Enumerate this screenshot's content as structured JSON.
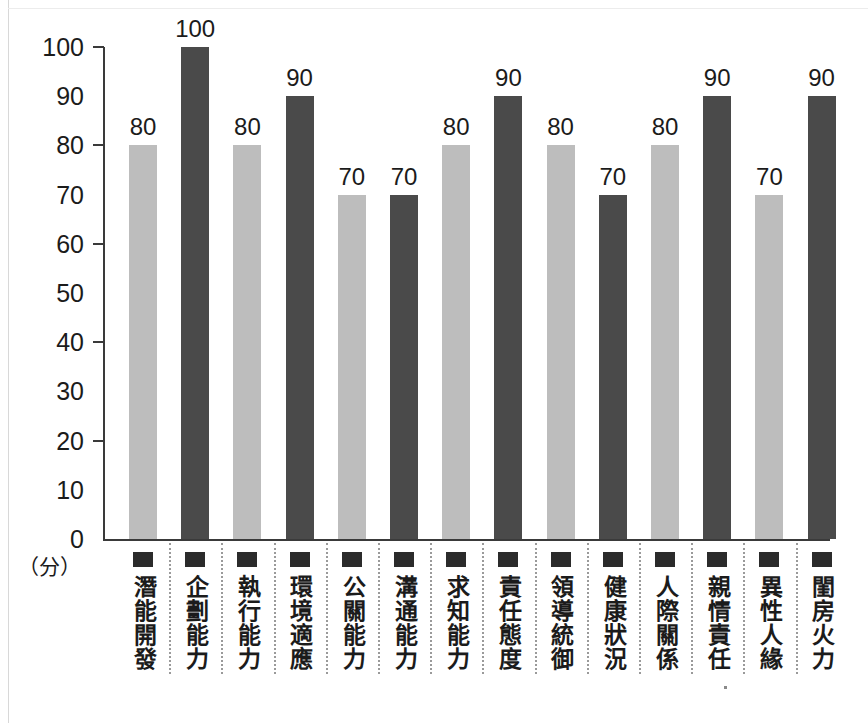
{
  "chart_data": {
    "type": "bar",
    "title": "",
    "subtitle": "",
    "xlabel": "",
    "ylabel": "(分)",
    "ylim": [
      0,
      100
    ],
    "grid": false,
    "legend": "none",
    "y_ticks": [
      100,
      90,
      80,
      70,
      60,
      50,
      40,
      30,
      20,
      10,
      0
    ],
    "y_major_ticks": [
      100,
      80,
      60,
      40,
      20,
      0
    ],
    "unit_label": "（分）",
    "categories": [
      "潛能開發",
      "企劃能力",
      "執行能力",
      "環境適應",
      "公關能力",
      "溝通能力",
      "求知能力",
      "責任態度",
      "領導統御",
      "健康狀況",
      "人際關係",
      "親情責任",
      "異性人緣",
      "閨房火力"
    ],
    "values": [
      80,
      100,
      80,
      90,
      70,
      70,
      80,
      90,
      80,
      70,
      80,
      90,
      70,
      90
    ],
    "bar_colors": [
      "#bdbdbd",
      "#4a4a4a",
      "#bdbdbd",
      "#4a4a4a",
      "#bdbdbd",
      "#4a4a4a",
      "#bdbdbd",
      "#4a4a4a",
      "#bdbdbd",
      "#4a4a4a",
      "#bdbdbd",
      "#4a4a4a",
      "#bdbdbd",
      "#4a4a4a"
    ],
    "data_labels": [
      "80",
      "100",
      "80",
      "90",
      "70",
      "70",
      "80",
      "90",
      "80",
      "70",
      "80",
      "90",
      "70",
      "90"
    ],
    "colors": {
      "light_bar": "#bdbdbd",
      "dark_bar": "#4a4a4a",
      "axis": "#3a3a3a",
      "text": "#1b1b1b",
      "separator": "#9a9a9a",
      "marker": "#2b2b2b",
      "background": "#ffffff"
    }
  }
}
